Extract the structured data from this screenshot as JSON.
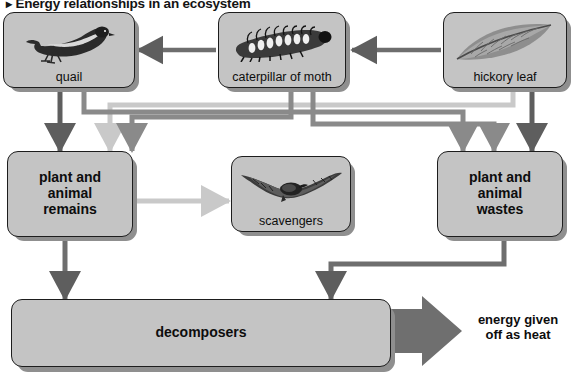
{
  "title": {
    "bullet": "▸",
    "text": "Energy relationships in an ecosystem"
  },
  "colors": {
    "box_fill": "#c4c4c4",
    "box_border": "#1d1d1d",
    "arrow_dark": "#5e5e5e",
    "arrow_medium": "#8a8a8a",
    "arrow_light": "#c9c9c9",
    "heat_arrow": "#6f6f6f",
    "background": "#ffffff"
  },
  "nodes": [
    {
      "id": "quail",
      "label": "quail",
      "icon": "quail-bird-illustration",
      "bold": false
    },
    {
      "id": "caterpillar",
      "label": "caterpillar of moth",
      "icon": "caterpillar-illustration",
      "bold": false
    },
    {
      "id": "hickory-leaf",
      "label": "hickory  leaf",
      "icon": "hickory-leaf-illustration",
      "bold": false
    },
    {
      "id": "plant-animal-remains",
      "label": "plant and\nanimal\nremains",
      "icon": "none",
      "bold": true
    },
    {
      "id": "scavengers",
      "label": "scavengers",
      "icon": "hawk-scavenger-illustration",
      "bold": false
    },
    {
      "id": "plant-animal-wastes",
      "label": "plant and\nanimal\nwastes",
      "icon": "none",
      "bold": true
    },
    {
      "id": "decomposers",
      "label": "decomposers",
      "icon": "none",
      "bold": true
    }
  ],
  "heat_output": {
    "label": "energy given\noff as heat",
    "arrow": "large-right-arrow"
  },
  "flows": [
    {
      "from": "hickory-leaf",
      "to": "caterpillar",
      "tone": "dark"
    },
    {
      "from": "caterpillar",
      "to": "quail",
      "tone": "dark"
    },
    {
      "from": "quail",
      "to": "plant-animal-remains",
      "tone": "dark"
    },
    {
      "from": "caterpillar",
      "to": "plant-animal-remains",
      "tone": "medium"
    },
    {
      "from": "hickory-leaf",
      "to": "plant-animal-remains",
      "tone": "light"
    },
    {
      "from": "quail",
      "to": "plant-animal-wastes",
      "tone": "medium"
    },
    {
      "from": "caterpillar",
      "to": "plant-animal-wastes",
      "tone": "medium"
    },
    {
      "from": "hickory-leaf",
      "to": "plant-animal-wastes",
      "tone": "dark"
    },
    {
      "from": "plant-animal-remains",
      "to": "scavengers",
      "tone": "light"
    },
    {
      "from": "plant-animal-remains",
      "to": "decomposers",
      "tone": "dark"
    },
    {
      "from": "plant-animal-wastes",
      "to": "decomposers",
      "tone": "dark"
    },
    {
      "from": "decomposers",
      "to": "heat_output",
      "tone": "heat"
    }
  ]
}
